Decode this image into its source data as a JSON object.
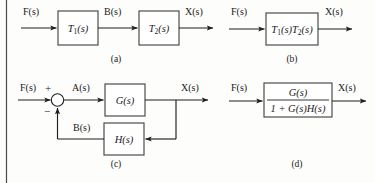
{
  "figure": {
    "background_color": "#fdfdfc",
    "line_color": "#1f1f1f",
    "box_stroke_color": "#3d3d3d",
    "text_color": "#1a1a1a",
    "border_color": "#4a4a4a"
  },
  "panels": [
    {
      "id": "a",
      "caption": "(a)",
      "type": "cascade",
      "input_label": "F(s)",
      "intermediate_label": "B(s)",
      "output_label": "X(s)",
      "blocks": [
        {
          "label": "T₁(s)",
          "label_base": "T",
          "label_sub": "1",
          "label_tail": "(s)"
        },
        {
          "label": "T₂(s)",
          "label_base": "T",
          "label_sub": "2",
          "label_tail": "(s)"
        }
      ]
    },
    {
      "id": "b",
      "caption": "(b)",
      "type": "single",
      "input_label": "F(s)",
      "output_label": "X(s)",
      "blocks": [
        {
          "label": "T₁(s)T₂(s)"
        }
      ]
    },
    {
      "id": "c",
      "caption": "(c)",
      "type": "feedback",
      "input_label": "F(s)",
      "error_label": "A(s)",
      "feedback_label": "B(s)",
      "output_label": "X(s)",
      "summer": {
        "plus_sign": "+",
        "minus_sign": "−"
      },
      "blocks": [
        {
          "label": "G(s)",
          "role": "forward"
        },
        {
          "label": "H(s)",
          "role": "feedback"
        }
      ]
    },
    {
      "id": "d",
      "caption": "(d)",
      "type": "single-fraction",
      "input_label": "F(s)",
      "output_label": "X(s)",
      "blocks": [
        {
          "numerator": "G(s)",
          "denominator": "1 + G(s)H(s)"
        }
      ]
    }
  ]
}
